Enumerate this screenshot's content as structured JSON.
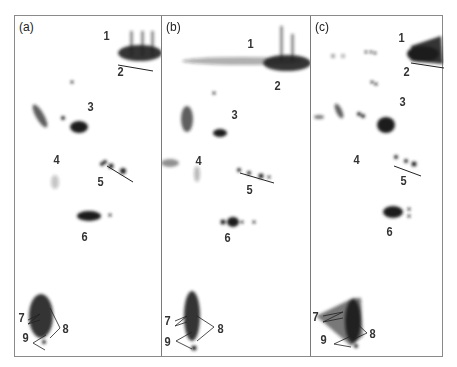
{
  "figure": {
    "panels": [
      {
        "id": "a",
        "label": "(a)"
      },
      {
        "id": "b",
        "label": "(b)"
      },
      {
        "id": "c",
        "label": "(c)"
      }
    ],
    "spot_labels": [
      "1",
      "2",
      "3",
      "4",
      "5",
      "6",
      "7",
      "8",
      "9"
    ],
    "colors": {
      "frame": "#8a8a8a",
      "spot": "#1e1e1e",
      "text": "#333333"
    }
  }
}
